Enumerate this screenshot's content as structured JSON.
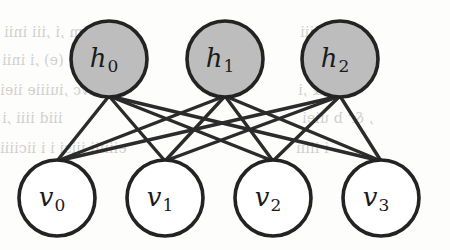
{
  "figure": {
    "kind": "restricted-boltzmann-machine-diagram",
    "background_color": "#fdfdfc",
    "edge_color": "#2b2b2b",
    "node_outline_color": "#232323"
  },
  "layers": {
    "hidden": {
      "name": "hidden-layer",
      "fill_color": "#bdbdbd",
      "radius": 38,
      "center_y": 59,
      "nodes": [
        {
          "id": "h0",
          "base": "h",
          "subscript": "0",
          "cx": 109,
          "cy": 59
        },
        {
          "id": "h1",
          "base": "h",
          "subscript": "1",
          "cx": 225,
          "cy": 59
        },
        {
          "id": "h2",
          "base": "h",
          "subscript": "2",
          "cx": 340,
          "cy": 59
        }
      ]
    },
    "visible": {
      "name": "visible-layer",
      "fill_color": "#ffffff",
      "radius": 38,
      "center_y": 198,
      "nodes": [
        {
          "id": "v0",
          "base": "v",
          "subscript": "0",
          "cx": 57,
          "cy": 198
        },
        {
          "id": "v1",
          "base": "v",
          "subscript": "1",
          "cx": 165,
          "cy": 198
        },
        {
          "id": "v2",
          "base": "v",
          "subscript": "2",
          "cx": 273,
          "cy": 198
        },
        {
          "id": "v3",
          "base": "v",
          "subscript": "3",
          "cx": 381,
          "cy": 198
        }
      ]
    }
  },
  "edges": [
    {
      "from": "h0",
      "to": "v0"
    },
    {
      "from": "h0",
      "to": "v1"
    },
    {
      "from": "h0",
      "to": "v2"
    },
    {
      "from": "h0",
      "to": "v3"
    },
    {
      "from": "h1",
      "to": "v0"
    },
    {
      "from": "h1",
      "to": "v1"
    },
    {
      "from": "h1",
      "to": "v2"
    },
    {
      "from": "h1",
      "to": "v3"
    },
    {
      "from": "h2",
      "to": "v0"
    },
    {
      "from": "h2",
      "to": "v1"
    },
    {
      "from": "h2",
      "to": "v2"
    },
    {
      "from": "h2",
      "to": "v3"
    }
  ],
  "background_bleed_text": {
    "left": [
      "niim ,i ,iii inii",
      "(e) ,i inii",
      "es savc ,iuiiie iiei",
      "iiid iiii ,i",
      "eiiiiii iiisi i i iiciiii"
    ],
    "right": [
      "iiiiiiii",
      "(e) ,i",
      "ovi& ,i",
      ", &' b uiei",
      "i iiiii"
    ]
  }
}
